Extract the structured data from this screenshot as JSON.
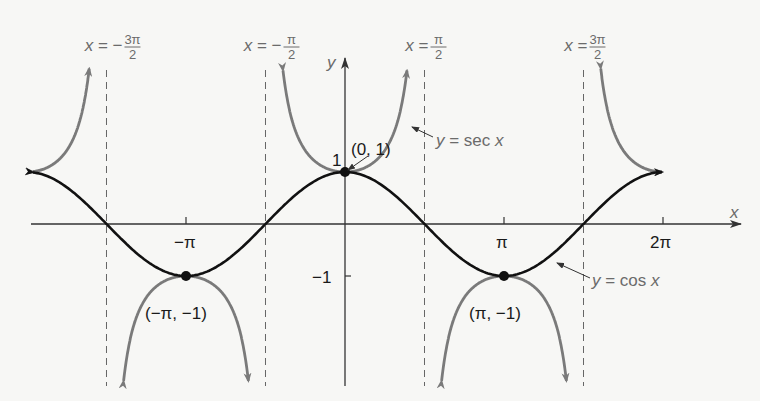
{
  "chart_data": {
    "type": "line",
    "title": "",
    "xlabel": "x",
    "ylabel": "y",
    "x_ticks": [
      {
        "value": -3.14159,
        "label": "−π"
      },
      {
        "value": 3.14159,
        "label": "π"
      },
      {
        "value": 6.28318,
        "label": "2π"
      }
    ],
    "y_ticks": [
      {
        "value": 1,
        "label": "1"
      },
      {
        "value": -1,
        "label": "−1"
      }
    ],
    "xlim": [
      -7.1,
      7.4
    ],
    "ylim": [
      -3.1,
      3.15
    ],
    "grid": false,
    "series": [
      {
        "name": "y = cos x",
        "color": "#111111",
        "function": "cos",
        "domain": [
          -6.0,
          6.0
        ]
      },
      {
        "name": "y = sec x",
        "color": "#7a7a7a",
        "function": "sec",
        "domain": [
          -6.0,
          6.0
        ]
      }
    ],
    "asymptotes": [
      {
        "x": -4.71239,
        "label_pre": "x = −",
        "label_num": "3π",
        "label_den": "2"
      },
      {
        "x": -1.5708,
        "label_pre": "x = −",
        "label_num": "π",
        "label_den": "2"
      },
      {
        "x": 1.5708,
        "label_pre": "x = ",
        "label_num": "π",
        "label_den": "2"
      },
      {
        "x": 4.71239,
        "label_pre": "x = ",
        "label_num": "3π",
        "label_den": "2"
      }
    ],
    "points": [
      {
        "x": 0,
        "y": 1,
        "label": "(0, 1)"
      },
      {
        "x": -3.14159,
        "y": -1,
        "label": "(−π, −1)"
      },
      {
        "x": 3.14159,
        "y": -1,
        "label": "(π, −1)"
      }
    ],
    "annotations": [
      {
        "text": "y = sec x",
        "target": "sec curve near x=π/2"
      },
      {
        "text": "y = cos x",
        "target": "cos curve near x=3π/2"
      }
    ]
  },
  "labels": {
    "x_axis": "x",
    "y_axis": "y",
    "tick_neg_pi": "−π",
    "tick_pi": "π",
    "tick_2pi": "2π",
    "tick_y1": "1",
    "tick_yneg1": "−1",
    "pt_0_1": "(0, 1)",
    "pt_negpi": "(−π, −1)",
    "pt_pi": "(π, −1)",
    "sec_label": "y = sec x",
    "cos_label": "y = cos x"
  }
}
